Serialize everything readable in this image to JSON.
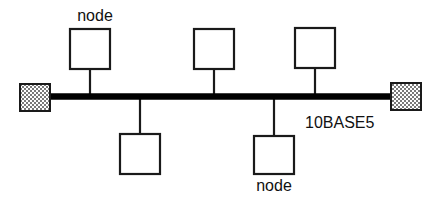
{
  "diagram": {
    "type": "network-bus-topology",
    "canvas": {
      "width": 441,
      "height": 198,
      "background": "#ffffff"
    },
    "colors": {
      "line": "#1a1a1a",
      "bus": "#000000",
      "box_fill": "#ffffff",
      "terminator_pattern": "#6e6e6e",
      "terminator_fill": "#ffffff",
      "text": "#111111"
    },
    "bus": {
      "label": "10BASE5",
      "label_x": 305,
      "label_y": 128,
      "y": 96.5,
      "x_start": 20,
      "x_end": 420,
      "thickness": 6.4
    },
    "terminators": [
      {
        "name": "left-terminator",
        "x": 20,
        "y": 84,
        "width": 30,
        "height": 27
      },
      {
        "name": "right-terminator",
        "x": 391,
        "y": 83,
        "width": 30,
        "height": 27
      }
    ],
    "nodes": [
      {
        "name": "node-top-1",
        "side": "top",
        "box": {
          "x": 70,
          "y": 29,
          "width": 40,
          "height": 40
        },
        "stem_x": 90,
        "label": "node",
        "label_x": 95,
        "label_y": 21
      },
      {
        "name": "node-top-2",
        "side": "top",
        "box": {
          "x": 194,
          "y": 29,
          "width": 40,
          "height": 40
        },
        "stem_x": 214,
        "label": "",
        "label_x": 0,
        "label_y": 0
      },
      {
        "name": "node-top-3",
        "side": "top",
        "box": {
          "x": 295,
          "y": 28,
          "width": 40,
          "height": 40
        },
        "stem_x": 315,
        "label": "",
        "label_x": 0,
        "label_y": 0
      },
      {
        "name": "node-bottom-1",
        "side": "bottom",
        "box": {
          "x": 120,
          "y": 134,
          "width": 40,
          "height": 40
        },
        "stem_x": 140,
        "label": "",
        "label_x": 0,
        "label_y": 0
      },
      {
        "name": "node-bottom-2",
        "side": "bottom",
        "box": {
          "x": 254,
          "y": 136,
          "width": 40,
          "height": 38
        },
        "stem_x": 274,
        "label": "node",
        "label_x": 274,
        "label_y": 191
      }
    ]
  }
}
